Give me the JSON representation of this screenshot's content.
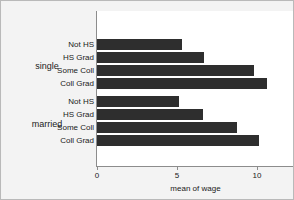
{
  "chart_data": {
    "type": "bar",
    "orientation": "horizontal",
    "title": "",
    "xlabel": "mean of wage",
    "ylabel": "",
    "xlim": [
      0,
      12.4
    ],
    "xticks": [
      0,
      5,
      10
    ],
    "xtick_labels": [
      "0",
      "5",
      "10"
    ],
    "grid": false,
    "legend": false,
    "groups": [
      {
        "name": "single",
        "categories": [
          "Not HS",
          "HS Grad",
          "Some Coll",
          "Coll Grad"
        ],
        "values": [
          5.3,
          6.7,
          9.8,
          10.6
        ]
      },
      {
        "name": "married",
        "categories": [
          "Not HS",
          "HS Grad",
          "Some Coll",
          "Coll Grad"
        ],
        "values": [
          5.1,
          6.6,
          8.75,
          10.1
        ]
      }
    ],
    "bar_color": "#2e2e2e"
  },
  "figure": {
    "background": "#f3f3f3",
    "plot_background": "#ffffff",
    "axis_color": "#8c8c8c"
  }
}
